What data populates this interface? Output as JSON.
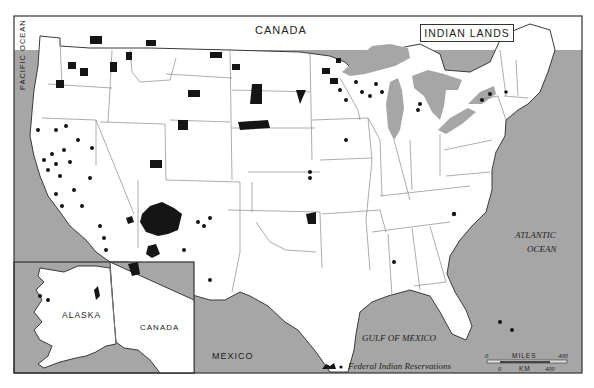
{
  "map": {
    "title": "INDIAN LANDS",
    "labels": {
      "canada_top": "CANADA",
      "pacific": "PACIFIC OCEAN",
      "atlantic_1": "ATLANTIC",
      "atlantic_2": "OCEAN",
      "gulf": "GULF OF MEXICO",
      "mexico": "MEXICO",
      "alaska": "ALASKA",
      "canada_inset": "CANADA"
    },
    "legend": {
      "label": "Federal Indian Reservations",
      "icon": "reservation-shape-and-dot-icon"
    },
    "scale": {
      "miles_label": "MILES",
      "km_label": "KM",
      "miles_start": "0",
      "miles_end": "400",
      "km_start": "0",
      "km_end": "400"
    },
    "colors": {
      "water": "#a6a6a6",
      "land": "#ffffff",
      "reservation": "#151515"
    }
  }
}
